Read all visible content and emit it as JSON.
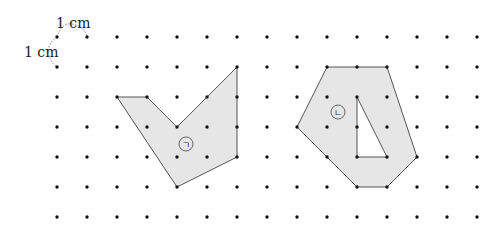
{
  "grid": {
    "origin": [
      57,
      37
    ],
    "spacing": 30,
    "columns": 15,
    "rows": 7,
    "dot_color": "#111111"
  },
  "scale": {
    "horizontal_label": "1 cm",
    "vertical_label": "1 cm"
  },
  "shapes": [
    {
      "id": "shape-giyeok",
      "label": "ㄱ",
      "label_pos": [
        186,
        144
      ],
      "vertices": [
        [
          2,
          2
        ],
        [
          3,
          2
        ],
        [
          4,
          3
        ],
        [
          6,
          1
        ],
        [
          6,
          4
        ],
        [
          4,
          5
        ]
      ],
      "holes": []
    },
    {
      "id": "shape-nieun",
      "label": "ㄴ",
      "label_pos": [
        338,
        112
      ],
      "vertices": [
        [
          9,
          1
        ],
        [
          11,
          1
        ],
        [
          12,
          4
        ],
        [
          11,
          5
        ],
        [
          10,
          5
        ],
        [
          8,
          3
        ]
      ],
      "holes": [
        [
          [
            10,
            2
          ],
          [
            10,
            4
          ],
          [
            11,
            4
          ]
        ]
      ]
    }
  ],
  "colors": {
    "fill": "#e6e6e6",
    "stroke": "#555555",
    "dashed": "#888888"
  }
}
